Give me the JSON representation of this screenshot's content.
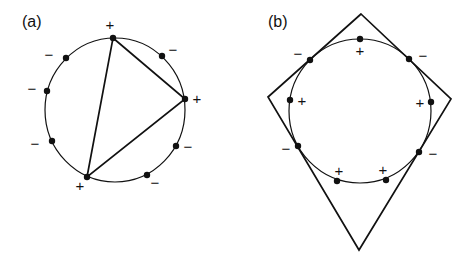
{
  "panels": [
    {
      "id": "a",
      "label": "(a)",
      "label_pos": [
        22,
        27
      ],
      "circle": {
        "cx": 115,
        "cy": 110,
        "rx": 70,
        "ry": 72
      },
      "polygon": {
        "type": "triangle",
        "points": [
          [
            113,
            38
          ],
          [
            185,
            99
          ],
          [
            87,
            177
          ]
        ]
      },
      "points": [
        {
          "x": 113,
          "y": 38,
          "sign": "+",
          "label_pos": [
            110,
            30
          ]
        },
        {
          "x": 162,
          "y": 56,
          "sign": "−",
          "label_pos": [
            173,
            55
          ]
        },
        {
          "x": 185,
          "y": 99,
          "sign": "+",
          "label_pos": [
            197,
            104
          ]
        },
        {
          "x": 176,
          "y": 146,
          "sign": "−",
          "label_pos": [
            188,
            152
          ]
        },
        {
          "x": 147,
          "y": 175,
          "sign": "−",
          "label_pos": [
            155,
            188
          ]
        },
        {
          "x": 87,
          "y": 177,
          "sign": "+",
          "label_pos": [
            80,
            191
          ]
        },
        {
          "x": 52,
          "y": 141,
          "sign": "−",
          "label_pos": [
            35,
            149
          ]
        },
        {
          "x": 47,
          "y": 91,
          "sign": "−",
          "label_pos": [
            32,
            94
          ]
        },
        {
          "x": 66,
          "y": 58,
          "sign": "−",
          "label_pos": [
            49,
            60
          ]
        }
      ]
    },
    {
      "id": "b",
      "label": "(b)",
      "label_pos": [
        268,
        27
      ],
      "circle": {
        "cx": 360,
        "cy": 111,
        "rx": 71,
        "ry": 72
      },
      "polygon": {
        "type": "quadrilateral",
        "points": [
          [
            361,
            14
          ],
          [
            451,
            99
          ],
          [
            359,
            250
          ],
          [
            268,
            97
          ]
        ]
      },
      "points": [
        {
          "x": 360,
          "y": 39,
          "sign": "+",
          "label_pos": [
            360,
            56
          ]
        },
        {
          "x": 409,
          "y": 59,
          "sign": "−",
          "label_pos": [
            423,
            61
          ]
        },
        {
          "x": 431,
          "y": 102,
          "sign": "+",
          "label_pos": [
            420,
            108
          ]
        },
        {
          "x": 419,
          "y": 152,
          "sign": "−",
          "label_pos": [
            433,
            159
          ]
        },
        {
          "x": 386,
          "y": 180,
          "sign": "+",
          "label_pos": [
            383,
            175
          ]
        },
        {
          "x": 337,
          "y": 181,
          "sign": "+",
          "label_pos": [
            339,
            176
          ]
        },
        {
          "x": 298,
          "y": 146,
          "sign": "−",
          "label_pos": [
            286,
            154
          ]
        },
        {
          "x": 290,
          "y": 100,
          "sign": "+",
          "label_pos": [
            302,
            106
          ]
        },
        {
          "x": 310,
          "y": 60,
          "sign": "−",
          "label_pos": [
            298,
            59
          ]
        }
      ]
    }
  ],
  "style": {
    "ink": "#111111",
    "background": "#ffffff"
  }
}
